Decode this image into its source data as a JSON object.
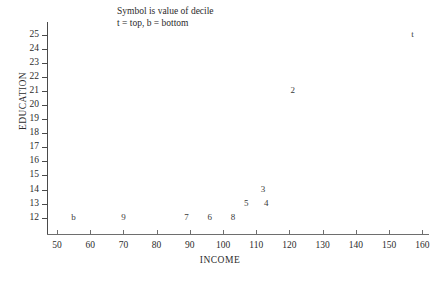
{
  "annotation": {
    "line1": "Symbol is value of decile",
    "line2": "t = top, b = bottom"
  },
  "chart_data": {
    "type": "scatter",
    "title": "",
    "xlabel": "INCOME",
    "ylabel": "EDUCATION",
    "xlim": [
      47,
      162
    ],
    "ylim": [
      11.2,
      25.9
    ],
    "grid": false,
    "legend": null,
    "x_ticks": [
      50,
      60,
      70,
      80,
      90,
      100,
      110,
      120,
      130,
      140,
      150,
      160
    ],
    "y_ticks": [
      12,
      13,
      14,
      15,
      16,
      17,
      18,
      19,
      20,
      21,
      22,
      23,
      24,
      25
    ],
    "point_label_note": "Each point is drawn as a text symbol naming its decile",
    "points": [
      {
        "label": "b",
        "x": 55,
        "y": 12
      },
      {
        "label": "9",
        "x": 70,
        "y": 12
      },
      {
        "label": "7",
        "x": 89,
        "y": 12
      },
      {
        "label": "6",
        "x": 96,
        "y": 12
      },
      {
        "label": "8",
        "x": 103,
        "y": 12
      },
      {
        "label": "5",
        "x": 107,
        "y": 13
      },
      {
        "label": "4",
        "x": 113,
        "y": 13
      },
      {
        "label": "3",
        "x": 112,
        "y": 14
      },
      {
        "label": "2",
        "x": 121,
        "y": 21
      },
      {
        "label": "t",
        "x": 157,
        "y": 25
      }
    ]
  }
}
